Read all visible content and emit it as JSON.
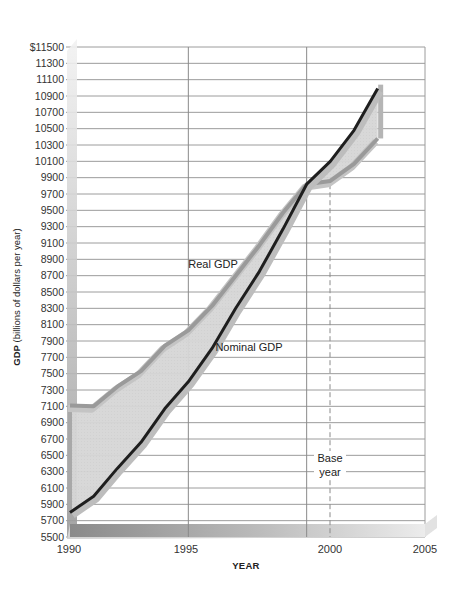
{
  "chart_data": {
    "type": "line",
    "title": "",
    "xlabel": "YEAR",
    "ylabel_bold": "GDP",
    "ylabel_rest": " (billions of dollars per year)",
    "ylim": [
      5500,
      11500
    ],
    "xlim": [
      1990,
      2005
    ],
    "grid": true,
    "x_tick_labels": [
      "1990",
      "1995",
      "2000",
      "2005"
    ],
    "y_tick_labels": [
      "$11500",
      "11300",
      "11100",
      "10900",
      "10700",
      "10500",
      "10300",
      "10100",
      "9900",
      "9700",
      "9500",
      "9300",
      "9100",
      "8900",
      "8700",
      "8500",
      "8300",
      "8100",
      "7900",
      "7700",
      "7500",
      "7300",
      "7100",
      "6900",
      "6700",
      "6500",
      "6300",
      "6100",
      "5900",
      "5700",
      "5500"
    ],
    "x": [
      1990,
      1991,
      1992,
      1993,
      1994,
      1995,
      1996,
      1997,
      1998,
      1999,
      2000,
      2001,
      2002,
      2003
    ],
    "series": [
      {
        "name": "Real GDP",
        "color": "#9a9a9a",
        "values": [
          7110,
          7100,
          7340,
          7530,
          7840,
          8030,
          8330,
          8700,
          9070,
          9470,
          9820,
          9860,
          10070,
          10380
        ]
      },
      {
        "name": "Nominal GDP",
        "color": "#1e1e1e",
        "values": [
          5800,
          6000,
          6340,
          6660,
          7070,
          7400,
          7810,
          8300,
          8750,
          9270,
          9820,
          10100,
          10480,
          10990
        ]
      }
    ],
    "annotations": [
      {
        "text": "Real GDP",
        "x": 1996.2,
        "y": 8700
      },
      {
        "text": "Nominal GDP",
        "x": 1996.5,
        "y": 7900
      },
      {
        "text": "Base",
        "x": 2000,
        "y": 6450
      },
      {
        "text": "year",
        "x": 2000,
        "y": 6200
      }
    ],
    "base_year": 2000,
    "legend": "none"
  }
}
